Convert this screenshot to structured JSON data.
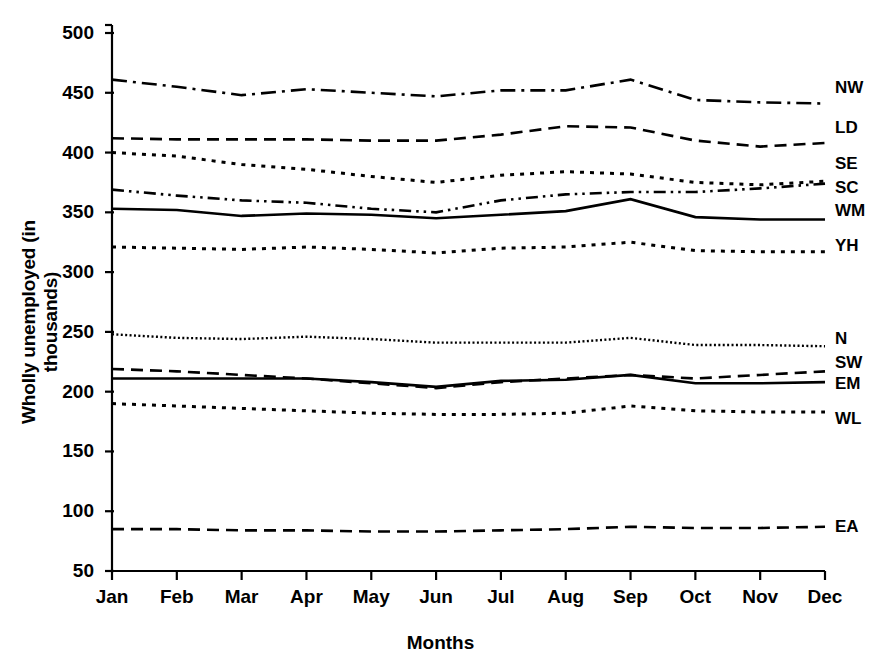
{
  "chart_data": {
    "type": "line",
    "title": "",
    "xlabel": "Months",
    "ylabel": "Wholly unemployed (in thousands)",
    "categories": [
      "Jan",
      "Feb",
      "Mar",
      "Apr",
      "May",
      "Jun",
      "Jul",
      "Aug",
      "Sep",
      "Oct",
      "Nov",
      "Dec"
    ],
    "x": [
      1,
      2,
      3,
      4,
      5,
      6,
      7,
      8,
      9,
      10,
      11,
      12
    ],
    "xtick_labels": [
      "Jan",
      "Feb",
      "Mar",
      "Apr",
      "May",
      "Jun",
      "Jul",
      "Aug",
      "Sep",
      "Oct",
      "Nov",
      "Dec"
    ],
    "ytick_labels": [
      "50",
      "100",
      "150",
      "200",
      "250",
      "300",
      "350",
      "400",
      "450",
      "500"
    ],
    "yticks": [
      50,
      100,
      150,
      200,
      250,
      300,
      350,
      400,
      450,
      500
    ],
    "ylim": [
      50,
      500
    ],
    "xlim": [
      1,
      12
    ],
    "grid": false,
    "legend_position": "right-inline-labels",
    "series": [
      {
        "name": "NW",
        "label": "NW",
        "linestyle": "dash-dot",
        "color": "#000000",
        "values": [
          461,
          455,
          448,
          453,
          450,
          447,
          452,
          452,
          461,
          444,
          442,
          441
        ]
      },
      {
        "name": "LD",
        "label": "LD",
        "linestyle": "dashed",
        "color": "#000000",
        "values": [
          412,
          411,
          411,
          411,
          410,
          410,
          415,
          422,
          421,
          410,
          405,
          408
        ]
      },
      {
        "name": "SE",
        "label": "SE",
        "linestyle": "dotted",
        "color": "#000000",
        "values": [
          400,
          397,
          390,
          386,
          380,
          375,
          381,
          384,
          382,
          375,
          373,
          376
        ]
      },
      {
        "name": "SC",
        "label": "SC",
        "linestyle": "dash-dot-dot",
        "color": "#000000",
        "values": [
          369,
          364,
          360,
          358,
          353,
          350,
          360,
          365,
          367,
          367,
          370,
          374
        ]
      },
      {
        "name": "WM",
        "label": "WM",
        "linestyle": "solid",
        "color": "#000000",
        "values": [
          353,
          352,
          347,
          349,
          348,
          345,
          348,
          351,
          361,
          346,
          344,
          344
        ]
      },
      {
        "name": "YH",
        "label": "YH",
        "linestyle": "dotted",
        "color": "#000000",
        "values": [
          321,
          320,
          319,
          321,
          319,
          316,
          320,
          321,
          325,
          318,
          317,
          317
        ]
      },
      {
        "name": "N",
        "label": "N",
        "linestyle": "fine-dotted",
        "color": "#000000",
        "values": [
          248,
          245,
          244,
          246,
          244,
          241,
          241,
          241,
          245,
          239,
          239,
          238
        ]
      },
      {
        "name": "SW",
        "label": "SW",
        "linestyle": "dashed",
        "color": "#000000",
        "values": [
          219,
          217,
          214,
          211,
          207,
          203,
          208,
          211,
          214,
          211,
          214,
          217
        ]
      },
      {
        "name": "EM",
        "label": "EM",
        "linestyle": "solid",
        "color": "#000000",
        "values": [
          211,
          211,
          211,
          211,
          208,
          204,
          209,
          210,
          214,
          207,
          207,
          208
        ]
      },
      {
        "name": "WL",
        "label": "WL",
        "linestyle": "dotted",
        "color": "#000000",
        "values": [
          190,
          188,
          186,
          184,
          182,
          181,
          181,
          182,
          188,
          184,
          183,
          183
        ]
      },
      {
        "name": "EA",
        "label": "EA",
        "linestyle": "dashed",
        "color": "#000000",
        "values": [
          85,
          85,
          84,
          84,
          83,
          83,
          84,
          85,
          87,
          86,
          86,
          87
        ]
      }
    ]
  },
  "axis": {
    "y_title": "Wholly unemployed (in thousands)",
    "x_title": "Months"
  }
}
